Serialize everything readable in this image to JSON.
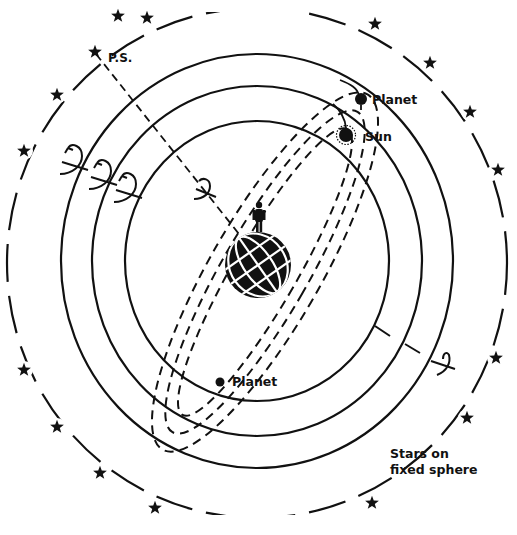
{
  "diagram": {
    "colors": {
      "ink": "#111111",
      "background": "#ffffff"
    },
    "center": {
      "x": 257,
      "y": 261
    },
    "spheres": [
      {
        "name": "inner-sphere",
        "rx": 132,
        "ry": 140
      },
      {
        "name": "middle-sphere",
        "rx": 165,
        "ry": 175
      },
      {
        "name": "outer-sphere",
        "rx": 196,
        "ry": 207
      }
    ],
    "star_sphere": {
      "rx": 250,
      "ry": 255
    },
    "stars": [
      [
        147,
        18
      ],
      [
        95,
        52
      ],
      [
        57,
        95
      ],
      [
        24,
        151
      ],
      [
        118,
        16
      ],
      [
        375,
        24
      ],
      [
        430,
        63
      ],
      [
        470,
        112
      ],
      [
        498,
        170
      ],
      [
        24,
        370
      ],
      [
        57,
        427
      ],
      [
        100,
        473
      ],
      [
        155,
        508
      ],
      [
        372,
        503
      ],
      [
        467,
        418
      ],
      [
        496,
        358
      ]
    ],
    "labels": {
      "pole_star": "P.S.",
      "planet_top": "Planet",
      "sun": "Sun",
      "planet_bottom": "Planet",
      "stars_line1": "Stars on",
      "stars_line2": "fixed sphere"
    }
  }
}
